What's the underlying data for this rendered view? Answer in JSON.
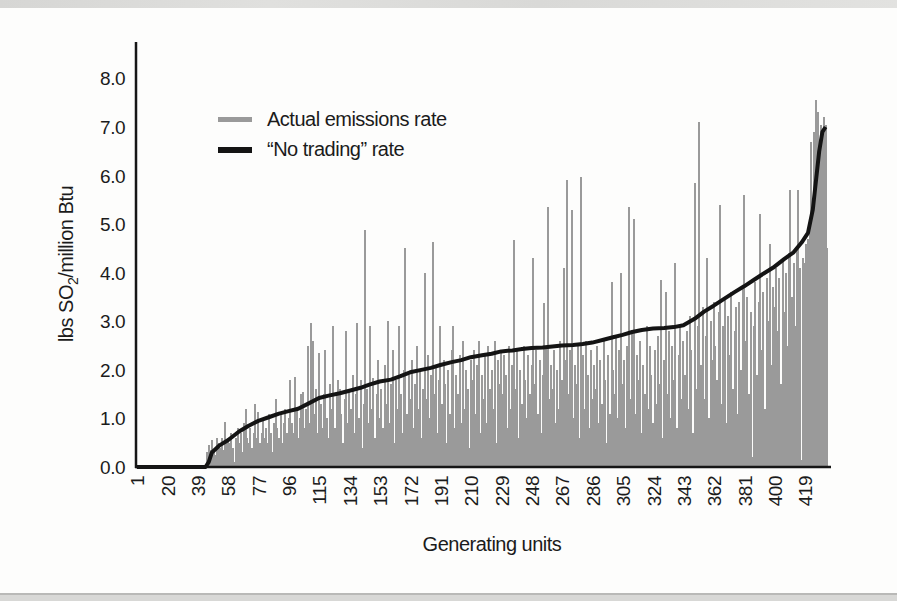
{
  "page": {
    "background": "#fdfdfc",
    "top_strip_color": "#dcdcda",
    "bottom_strip_color": "#d8d8d6",
    "text_color": "#1b1b1b"
  },
  "chart_data": {
    "type": "bar",
    "title": "",
    "xlabel": "Generating units",
    "ylabel": {
      "prefix": "lbs SO",
      "sub": "2",
      "suffix": "/million Btu"
    },
    "x_ticks": [
      1,
      20,
      39,
      58,
      77,
      96,
      115,
      134,
      153,
      172,
      191,
      210,
      229,
      248,
      267,
      286,
      305,
      324,
      343,
      362,
      381,
      400,
      419
    ],
    "y_ticks": [
      "0.0",
      "1.0",
      "2.0",
      "3.0",
      "4.0",
      "5.0",
      "6.0",
      "7.0",
      "8.0"
    ],
    "ylim": [
      0,
      8.6
    ],
    "total_units": 433,
    "grid": false,
    "legend_position": "top-left-inside",
    "legend": [
      {
        "label": "Actual emissions rate",
        "color": "#9a9a9a",
        "kind": "bar"
      },
      {
        "label": "“No trading” rate",
        "color": "#141414",
        "kind": "line"
      }
    ],
    "series": [
      {
        "name": "Actual emissions rate",
        "type": "bar",
        "color": "#9a9a9a",
        "start_unit": 45,
        "values": [
          0.3,
          0.45,
          0.35,
          0.55,
          0.3,
          0.25,
          0.6,
          0.5,
          0.4,
          0.6,
          0.35,
          0.93,
          0.5,
          0.6,
          0.5,
          0.7,
          0.4,
          0.1,
          0.6,
          0.8,
          0.5,
          0.7,
          0.3,
          0.9,
          1.2,
          0.6,
          0.5,
          0.8,
          0.4,
          0.7,
          1.3,
          0.6,
          1.13,
          0.5,
          0.7,
          1.0,
          0.6,
          0.8,
          0.5,
          1.1,
          0.7,
          0.3,
          0.9,
          1.4,
          0.8,
          0.6,
          1.1,
          0.5,
          0.9,
          1.2,
          0.7,
          1.0,
          1.8,
          0.9,
          0.7,
          1.85,
          1.2,
          0.6,
          1.0,
          1.5,
          1.55,
          0.8,
          1.2,
          2.5,
          0.9,
          2.96,
          2.6,
          1.1,
          1.6,
          0.7,
          2.35,
          1.3,
          0.8,
          1.5,
          2.4,
          1.0,
          0.6,
          1.7,
          1.2,
          2.9,
          0.8,
          1.5,
          1.8,
          1.6,
          1.1,
          0.5,
          1.4,
          2.8,
          0.9,
          1.6,
          1.2,
          1.9,
          0.7,
          1.5,
          2.96,
          1.0,
          1.8,
          0.4,
          1.3,
          4.88,
          1.6,
          0.9,
          2.9,
          1.2,
          1.83,
          0.6,
          1.5,
          2.2,
          1.0,
          1.6,
          0.8,
          2.1,
          1.3,
          3.0,
          0.9,
          1.7,
          2.4,
          0.5,
          1.8,
          1.2,
          2.9,
          1.5,
          0.7,
          2.0,
          4.5,
          1.1,
          1.9,
          1.4,
          2.2,
          0.8,
          1.7,
          2.5,
          1.2,
          2.0,
          0.6,
          1.6,
          4.0,
          1.4,
          2.3,
          1.0,
          1.9,
          4.63,
          1.5,
          2.1,
          0.7,
          1.8,
          2.9,
          1.3,
          2.2,
          1.7,
          0.5,
          2.0,
          1.1,
          2.4,
          2.9,
          0.8,
          1.9,
          1.5,
          2.3,
          0.9,
          2.6,
          1.2,
          2.0,
          1.6,
          0.4,
          2.2,
          1.8,
          2.4,
          1.1,
          2.1,
          2.6,
          0.7,
          1.9,
          1.4,
          2.3,
          0.9,
          2.5,
          1.6,
          2.0,
          1.2,
          2.6,
          0.5,
          2.2,
          1.7,
          2.4,
          1.5,
          2.3,
          1.9,
          0.8,
          2.5,
          1.2,
          2.1,
          4.67,
          1.6,
          2.4,
          0.6,
          2.0,
          1.3,
          2.5,
          1.8,
          1.0,
          2.3,
          1.5,
          2.1,
          4.3,
          1.7,
          2.4,
          1.1,
          2.2,
          0.7,
          1.9,
          3.37,
          2.5,
          5.35,
          1.4,
          2.1,
          1.6,
          2.4,
          0.9,
          2.0,
          1.2,
          2.6,
          1.8,
          4.1,
          2.2,
          5.9,
          1.5,
          2.4,
          5.3,
          1.0,
          2.1,
          1.7,
          2.5,
          0.6,
          5.97,
          2.3,
          1.2,
          2.6,
          1.9,
          0.8,
          2.4,
          1.4,
          2.1,
          1.6,
          2.5,
          0.9,
          2.2,
          1.3,
          2.6,
          1.8,
          0.5,
          2.3,
          1.1,
          3.8,
          2.0,
          1.5,
          2.7,
          1.0,
          2.4,
          4.0,
          1.7,
          2.2,
          0.8,
          2.5,
          5.35,
          1.4,
          2.8,
          5.1,
          1.1,
          2.3,
          1.8,
          2.6,
          0.7,
          2.1,
          1.5,
          2.9,
          1.2,
          2.5,
          1.9,
          0.9,
          2.4,
          1.3,
          2.7,
          1.7,
          3.85,
          0.6,
          2.2,
          3.6,
          1.5,
          2.8,
          1.0,
          2.5,
          1.8,
          4.2,
          0.8,
          2.3,
          2.9,
          1.4,
          2.6,
          1.9,
          2.8,
          1.2,
          3.1,
          2.4,
          0.7,
          5.85,
          1.6,
          2.9,
          7.1,
          2.1,
          3.3,
          1.4,
          2.7,
          4.3,
          1.0,
          3.0,
          2.2,
          3.4,
          2.5,
          1.8,
          3.2,
          5.4,
          1.3,
          2.9,
          3.5,
          0.9,
          3.1,
          2.3,
          3.6,
          1.6,
          2.8,
          3.3,
          1.1,
          3.4,
          2.0,
          3.7,
          5.6,
          2.6,
          3.5,
          1.5,
          3.2,
          0.2,
          2.9,
          3.8,
          1.9,
          3.4,
          5.2,
          2.4,
          3.6,
          1.2,
          3.9,
          3.0,
          4.6,
          2.1,
          3.7,
          3.3,
          4.1,
          2.8,
          3.9,
          1.7,
          4.3,
          3.2,
          4.0,
          2.5,
          4.4,
          5.7,
          3.5,
          4.2,
          2.9,
          4.5,
          5.7,
          4.1,
          0.15,
          4.3,
          4.2,
          4.6,
          4.7,
          5.0,
          6.7,
          5.2,
          6.9,
          7.55,
          7.3,
          6.5,
          7.05,
          6.9,
          7.2,
          7.05,
          4.5
        ]
      },
      {
        "name": "“No trading” rate",
        "type": "line",
        "color": "#141414",
        "points": [
          [
            1,
            0
          ],
          [
            44,
            0
          ],
          [
            46,
            0.1
          ],
          [
            48,
            0.3
          ],
          [
            53,
            0.45
          ],
          [
            58,
            0.55
          ],
          [
            65,
            0.73
          ],
          [
            71,
            0.85
          ],
          [
            77,
            0.95
          ],
          [
            84,
            1.03
          ],
          [
            90,
            1.1
          ],
          [
            96,
            1.15
          ],
          [
            102,
            1.2
          ],
          [
            108,
            1.3
          ],
          [
            115,
            1.42
          ],
          [
            121,
            1.47
          ],
          [
            128,
            1.52
          ],
          [
            134,
            1.57
          ],
          [
            141,
            1.63
          ],
          [
            147,
            1.7
          ],
          [
            153,
            1.76
          ],
          [
            160,
            1.8
          ],
          [
            166,
            1.87
          ],
          [
            172,
            1.95
          ],
          [
            179,
            2.0
          ],
          [
            185,
            2.04
          ],
          [
            191,
            2.1
          ],
          [
            198,
            2.16
          ],
          [
            204,
            2.2
          ],
          [
            210,
            2.26
          ],
          [
            217,
            2.3
          ],
          [
            223,
            2.33
          ],
          [
            229,
            2.38
          ],
          [
            236,
            2.4
          ],
          [
            242,
            2.43
          ],
          [
            248,
            2.45
          ],
          [
            255,
            2.46
          ],
          [
            261,
            2.48
          ],
          [
            267,
            2.5
          ],
          [
            274,
            2.51
          ],
          [
            280,
            2.53
          ],
          [
            286,
            2.56
          ],
          [
            293,
            2.62
          ],
          [
            299,
            2.67
          ],
          [
            305,
            2.72
          ],
          [
            311,
            2.78
          ],
          [
            317,
            2.82
          ],
          [
            324,
            2.85
          ],
          [
            331,
            2.86
          ],
          [
            337,
            2.88
          ],
          [
            343,
            2.92
          ],
          [
            350,
            3.05
          ],
          [
            356,
            3.2
          ],
          [
            362,
            3.32
          ],
          [
            368,
            3.45
          ],
          [
            375,
            3.6
          ],
          [
            381,
            3.72
          ],
          [
            387,
            3.85
          ],
          [
            393,
            3.98
          ],
          [
            399,
            4.1
          ],
          [
            406,
            4.28
          ],
          [
            412,
            4.42
          ],
          [
            417,
            4.62
          ],
          [
            421,
            4.82
          ],
          [
            424,
            5.3
          ],
          [
            426,
            5.9
          ],
          [
            428,
            6.5
          ],
          [
            430,
            6.9
          ],
          [
            432,
            7.0
          ]
        ]
      }
    ]
  }
}
